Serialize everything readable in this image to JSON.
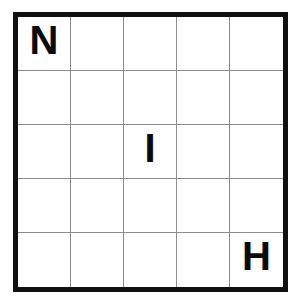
{
  "puzzle": {
    "type": "letter-grid",
    "rows": 5,
    "columns": 5,
    "border_color": "#111111",
    "gridline_color": "#8c8c8c",
    "background_color": "#ffffff",
    "letter_color": "#0a0a0a",
    "cells": [
      [
        {
          "letter": "N"
        },
        {
          "letter": ""
        },
        {
          "letter": ""
        },
        {
          "letter": ""
        },
        {
          "letter": ""
        }
      ],
      [
        {
          "letter": ""
        },
        {
          "letter": ""
        },
        {
          "letter": ""
        },
        {
          "letter": ""
        },
        {
          "letter": ""
        }
      ],
      [
        {
          "letter": ""
        },
        {
          "letter": ""
        },
        {
          "letter": "I"
        },
        {
          "letter": ""
        },
        {
          "letter": ""
        }
      ],
      [
        {
          "letter": ""
        },
        {
          "letter": ""
        },
        {
          "letter": ""
        },
        {
          "letter": ""
        },
        {
          "letter": ""
        }
      ],
      [
        {
          "letter": ""
        },
        {
          "letter": ""
        },
        {
          "letter": ""
        },
        {
          "letter": ""
        },
        {
          "letter": "H"
        }
      ]
    ]
  }
}
